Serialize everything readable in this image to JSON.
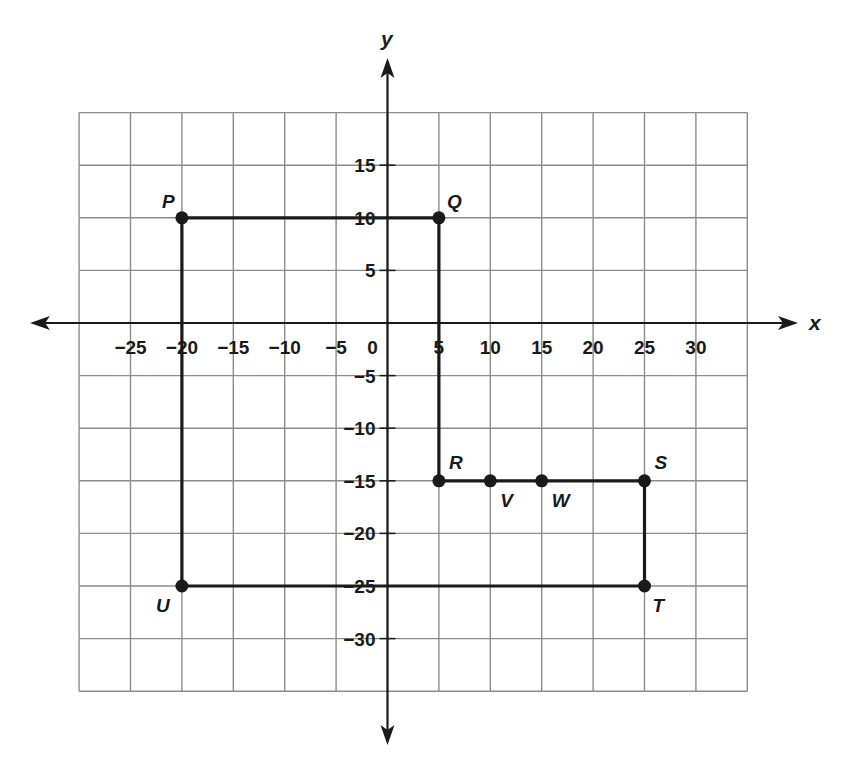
{
  "chart_data": {
    "type": "scatter",
    "title": "",
    "xlabel": "x",
    "ylabel": "y",
    "xlim": [
      -30,
      35
    ],
    "ylim": [
      -35,
      20
    ],
    "grid": true,
    "grid_step": 5,
    "x_ticks": [
      -25,
      -20,
      -15,
      -10,
      -5,
      0,
      5,
      10,
      15,
      20,
      25,
      30
    ],
    "x_tick_labels": [
      "−25",
      "−20",
      "−15",
      "−10",
      "−5",
      "0",
      "5",
      "10",
      "15",
      "20",
      "25",
      "30"
    ],
    "y_ticks": [
      15,
      10,
      5,
      -5,
      -10,
      -15,
      -20,
      -25,
      -30
    ],
    "y_tick_labels": [
      "15",
      "10",
      "5",
      "−5",
      "−10",
      "−15",
      "−20",
      "−25",
      "−30"
    ],
    "points": [
      {
        "label": "P",
        "x": -20,
        "y": 10
      },
      {
        "label": "Q",
        "x": 5,
        "y": 10
      },
      {
        "label": "R",
        "x": 5,
        "y": -15
      },
      {
        "label": "V",
        "x": 10,
        "y": -15
      },
      {
        "label": "W",
        "x": 15,
        "y": -15
      },
      {
        "label": "S",
        "x": 25,
        "y": -15
      },
      {
        "label": "T",
        "x": 25,
        "y": -25
      },
      {
        "label": "U",
        "x": -20,
        "y": -25
      }
    ],
    "polygon": [
      "P",
      "Q",
      "R",
      "S",
      "T",
      "U"
    ],
    "legend": null
  },
  "colors": {
    "grid": "#8c8c8c",
    "axis": "#1a1a1a",
    "shape": "#1a1a1a",
    "background": "#ffffff"
  }
}
